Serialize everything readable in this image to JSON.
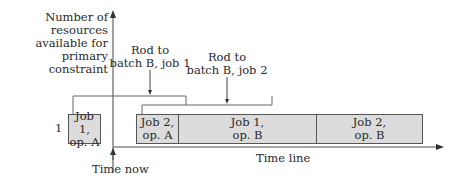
{
  "y_axis_label": [
    "Number of resources",
    "available for",
    "primary constraint"
  ],
  "y_tick": "1",
  "x_axis_label": "Time line",
  "time_now_label": "Time now",
  "annotations": [
    {
      "lines": [
        "Rod to",
        "batch B, job 1"
      ]
    },
    {
      "lines": [
        "Rod to",
        "batch B, job 2"
      ]
    }
  ],
  "boxes": [
    {
      "lines": [
        "Job 1,",
        "op. A"
      ]
    },
    {
      "lines": [
        "Job 2,",
        "op. A"
      ]
    },
    {
      "lines": [
        "Job 1,",
        "op. B"
      ]
    },
    {
      "lines": [
        "Job 2,",
        "op. B"
      ]
    }
  ],
  "colors": {
    "box_fill": "#dcdcdc",
    "line": "#555555"
  }
}
